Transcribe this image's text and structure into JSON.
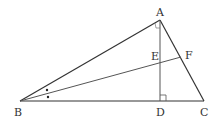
{
  "diagram": {
    "type": "geometry-triangle",
    "colors": {
      "stroke": "#333333",
      "thin_stroke": "#555555",
      "label": "#333333",
      "background": "#ffffff"
    },
    "points": {
      "A": {
        "label": "A",
        "x": 160,
        "y": 20
      },
      "B": {
        "label": "B",
        "x": 20,
        "y": 101
      },
      "C": {
        "label": "C",
        "x": 204,
        "y": 101
      },
      "D": {
        "label": "D",
        "x": 160,
        "y": 101
      },
      "E": {
        "label": "E",
        "x": 160,
        "y": 62
      },
      "F": {
        "label": "F",
        "x": 181,
        "y": 57
      }
    },
    "segments": [
      "AB",
      "BC",
      "CA",
      "AD",
      "BF"
    ],
    "marks": {
      "right_angle_at_D": "AD ⟂ BC",
      "right_angle_at_A": "∠BAC = 90°",
      "equal_angles_at_B": "∠ABF = ∠FBC (two dots)"
    }
  }
}
